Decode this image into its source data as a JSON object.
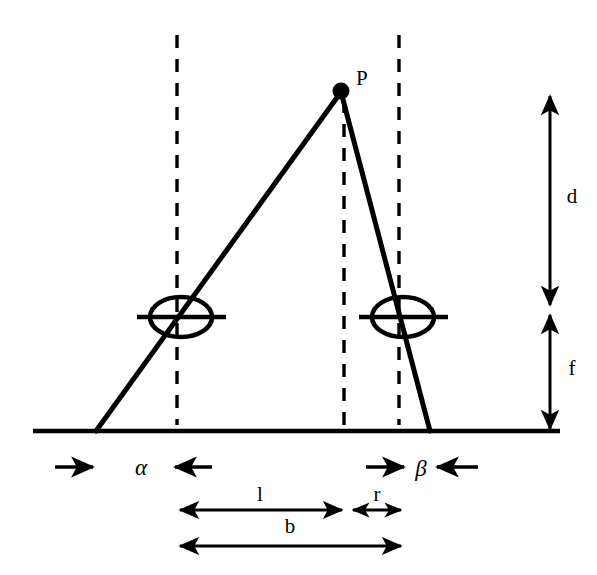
{
  "figure": {
    "type": "geometry-diagram",
    "background_color": "#ffffff",
    "stroke_color": "#000000"
  },
  "points": {
    "apex": {
      "label": "P",
      "x": 341,
      "y": 91,
      "label_x": 356,
      "label_y": 84
    }
  },
  "labels": {
    "point_p": "P",
    "distance_d": "d",
    "focal_f": "f",
    "angle_alpha": "α",
    "angle_beta": "β",
    "length_l": "l",
    "length_r": "r",
    "baseline_b": "b"
  },
  "geometry": {
    "ground_line": {
      "x1": 33,
      "y1": 431,
      "x2": 560,
      "y2": 431
    },
    "left_ray": {
      "x1": 96,
      "y1": 431,
      "x2": 341,
      "y2": 91
    },
    "right_ray": {
      "x1": 430,
      "y1": 431,
      "x2": 341,
      "y2": 91
    },
    "dashed_lines": [
      {
        "name": "left-optical-axis",
        "x": 177,
        "y1": 35,
        "y2": 425
      },
      {
        "name": "apex-vertical",
        "x": 344,
        "y1": 100,
        "y2": 425
      },
      {
        "name": "right-optical-axis",
        "x": 399,
        "y1": 35,
        "y2": 425
      }
    ],
    "lenses": [
      {
        "name": "left-lens",
        "cx": 181,
        "cy": 317,
        "rx": 31,
        "ry": 20,
        "line_x1": 137,
        "line_x2": 226
      },
      {
        "name": "right-lens",
        "cx": 403,
        "cy": 317,
        "rx": 31,
        "ry": 20,
        "line_x1": 359,
        "line_x2": 448
      }
    ]
  },
  "measurements": {
    "vertical_axis_x": 550,
    "d": {
      "label": "d",
      "y_top": 95,
      "y_bottom": 306,
      "label_x": 572,
      "label_y": 202
    },
    "f": {
      "label": "f",
      "y_top": 313,
      "y_bottom": 430,
      "label_x": 572,
      "label_y": 374
    },
    "alpha": {
      "label": "α",
      "y": 467,
      "arrow_in_left": {
        "x1": 55,
        "x2": 96
      },
      "arrow_in_right": {
        "x1": 212,
        "x2": 172
      },
      "label_x": 140,
      "label_y": 473
    },
    "beta": {
      "label": "β",
      "y": 467,
      "arrow_in_left": {
        "x1": 366,
        "x2": 406
      },
      "arrow_in_right": {
        "x1": 478,
        "x2": 436
      },
      "label_x": 421,
      "label_y": 473
    },
    "l": {
      "label": "l",
      "y": 510,
      "x1": 177,
      "x2": 344,
      "label_x": 260,
      "label_y": 500
    },
    "r": {
      "label": "r",
      "y": 510,
      "x1": 351,
      "x2": 402,
      "label_x": 377,
      "label_y": 500
    },
    "b": {
      "label": "b",
      "y": 546,
      "x1": 177,
      "x2": 403,
      "label_x": 290,
      "label_y": 532
    }
  }
}
